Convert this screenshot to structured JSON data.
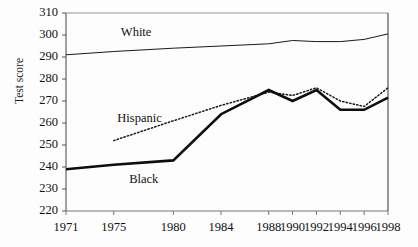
{
  "chart_data": {
    "type": "line",
    "title": "",
    "xlabel": "",
    "ylabel": "Test score",
    "x": [
      1971,
      1975,
      1980,
      1984,
      1988,
      1990,
      1992,
      1994,
      1996,
      1998
    ],
    "xticklabels": [
      "1971",
      "1975",
      "1980",
      "1984",
      "1988",
      "1990",
      "1992",
      "1994",
      "1996",
      "1998"
    ],
    "yticklabels": [
      "310",
      "300",
      "290",
      "280",
      "270",
      "260",
      "250",
      "240",
      "230",
      "220"
    ],
    "yticks": [
      310,
      300,
      290,
      280,
      270,
      260,
      250,
      240,
      230,
      220
    ],
    "ylim": [
      220,
      310
    ],
    "xlim": [
      1971,
      1998
    ],
    "grid": false,
    "legend_position": "inline-annotations",
    "series": [
      {
        "name": "White",
        "style": "solid-thin",
        "color": "#1a1a1a",
        "x": [
          1971,
          1975,
          1980,
          1984,
          1988,
          1990,
          1992,
          1994,
          1996,
          1998
        ],
        "values": [
          291,
          292.5,
          294,
          295,
          296,
          297.5,
          297,
          297,
          298,
          300.5
        ]
      },
      {
        "name": "Hispanic",
        "style": "dotted",
        "color": "#1a1a1a",
        "x": [
          1975,
          1980,
          1984,
          1988,
          1990,
          1992,
          1994,
          1996,
          1998
        ],
        "values": [
          252,
          261,
          268,
          274,
          272.5,
          276,
          270,
          267.5,
          276
        ]
      },
      {
        "name": "Black",
        "style": "solid-thick",
        "color": "#0d0d0d",
        "x": [
          1971,
          1975,
          1980,
          1984,
          1988,
          1990,
          1992,
          1994,
          1996,
          1998
        ],
        "values": [
          239,
          241,
          243,
          264,
          275,
          270,
          275,
          266,
          266,
          271.5
        ]
      }
    ],
    "annotations": [
      {
        "text": "White",
        "x": 1975.6,
        "y": 301
      },
      {
        "text": "Hispanic",
        "x": 1975.3,
        "y": 262
      },
      {
        "text": "Black",
        "x": 1976.3,
        "y": 234
      }
    ]
  }
}
